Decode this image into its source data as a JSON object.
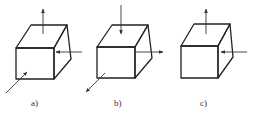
{
  "figure": {
    "panels": [
      {
        "id": "a",
        "label": "a)",
        "arrows": [
          "up-from-top-face",
          "left-into-right-face",
          "into-front-face-from-lower-left"
        ]
      },
      {
        "id": "b",
        "label": "b)",
        "arrows": [
          "down-into-top-face",
          "right-out-of-right-face",
          "out-of-front-face-to-lower-left"
        ]
      },
      {
        "id": "c",
        "label": "c)",
        "arrows": [
          "up-from-top-face",
          "left-into-right-face"
        ]
      }
    ],
    "colors": {
      "edge": "#222222",
      "arrow": "#333333",
      "background": "#ffffff"
    }
  }
}
